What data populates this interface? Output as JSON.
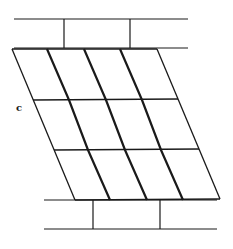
{
  "diagram": {
    "label": "c",
    "stroke_color": "#1a1a1a",
    "top_band": {
      "lines_y": [
        19,
        48
      ],
      "x_start": 14,
      "x_end": 188,
      "dividers_x": [
        64,
        130
      ]
    },
    "bottom_band": {
      "lines_y": [
        199,
        229
      ],
      "x_start": 44,
      "x_end": 217,
      "dividers_x": [
        93,
        160
      ]
    },
    "grid": {
      "rows": 3,
      "columns": 4,
      "row_y": [
        49,
        99,
        149,
        199
      ],
      "row_left_x": [
        12,
        33,
        54,
        75
      ],
      "column_spacing": 36.5,
      "thick_lines": [
        1,
        2,
        3
      ]
    }
  }
}
